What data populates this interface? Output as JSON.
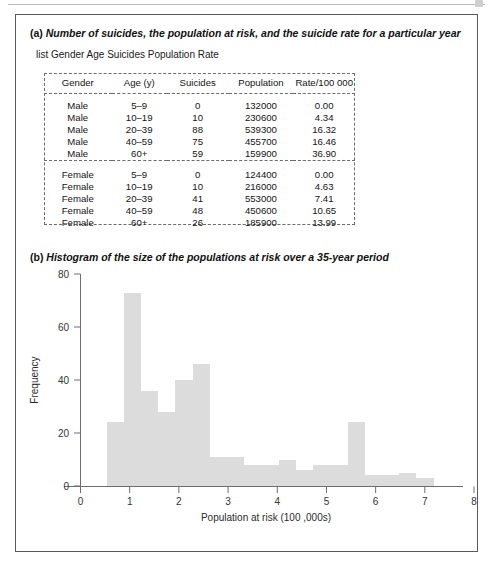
{
  "figure": {
    "panel_a": {
      "label": "(a)",
      "caption": "Number of suicides, the population at risk, and the suicide rate for a particular year",
      "command": "list Gender Age Suicides Population Rate",
      "table": {
        "headers": [
          "Gender",
          "Age (y)",
          "Suicides",
          "Population",
          "Rate/100 000"
        ],
        "groups": [
          {
            "rows": [
              [
                "Male",
                "5–9",
                "0",
                "132000",
                "0.00"
              ],
              [
                "Male",
                "10–19",
                "10",
                "230600",
                "4.34"
              ],
              [
                "Male",
                "20–39",
                "88",
                "539300",
                "16.32"
              ],
              [
                "Male",
                "40–59",
                "75",
                "455700",
                "16.46"
              ],
              [
                "Male",
                "60+",
                "59",
                "159900",
                "36.90"
              ]
            ]
          },
          {
            "rows": [
              [
                "Female",
                "5–9",
                "0",
                "124400",
                "0.00"
              ],
              [
                "Female",
                "10–19",
                "10",
                "216000",
                "4.63"
              ],
              [
                "Female",
                "20–39",
                "41",
                "553000",
                "7.41"
              ],
              [
                "Female",
                "40–59",
                "48",
                "450600",
                "10.65"
              ],
              [
                "Female",
                "60+",
                "26",
                "185900",
                "13.99"
              ]
            ]
          }
        ]
      }
    },
    "panel_b": {
      "label": "(b)",
      "caption": "Histogram of the size of the populations at risk over a 35-year period"
    }
  },
  "chart_data": {
    "type": "bar",
    "title": "Histogram of the size of the populations at risk over a 35-year period",
    "xlabel": "Population at risk (100 ,000s)",
    "ylabel": "Frequency",
    "xlim": [
      0,
      8
    ],
    "ylim": [
      0,
      80
    ],
    "xticks": [
      0,
      1,
      2,
      3,
      4,
      5,
      6,
      7,
      8
    ],
    "yticks": [
      0,
      20,
      40,
      60,
      80
    ],
    "grid": false,
    "bin_width": 0.35,
    "bar_color": "#dcdcdc",
    "bins": [
      {
        "x0": 0.53,
        "x1": 0.88,
        "value": 24
      },
      {
        "x0": 0.88,
        "x1": 1.23,
        "value": 73
      },
      {
        "x0": 1.23,
        "x1": 1.58,
        "value": 36
      },
      {
        "x0": 1.58,
        "x1": 1.93,
        "value": 28
      },
      {
        "x0": 1.93,
        "x1": 2.28,
        "value": 40
      },
      {
        "x0": 2.28,
        "x1": 2.63,
        "value": 46
      },
      {
        "x0": 2.63,
        "x1": 2.98,
        "value": 11
      },
      {
        "x0": 2.98,
        "x1": 3.33,
        "value": 11
      },
      {
        "x0": 3.33,
        "x1": 3.68,
        "value": 8
      },
      {
        "x0": 3.68,
        "x1": 4.03,
        "value": 8
      },
      {
        "x0": 4.03,
        "x1": 4.38,
        "value": 10
      },
      {
        "x0": 4.38,
        "x1": 4.73,
        "value": 6
      },
      {
        "x0": 4.73,
        "x1": 5.08,
        "value": 8
      },
      {
        "x0": 5.08,
        "x1": 5.43,
        "value": 8
      },
      {
        "x0": 5.43,
        "x1": 5.78,
        "value": 24
      },
      {
        "x0": 5.78,
        "x1": 6.13,
        "value": 4
      },
      {
        "x0": 6.13,
        "x1": 6.48,
        "value": 4
      },
      {
        "x0": 6.48,
        "x1": 6.83,
        "value": 5
      },
      {
        "x0": 6.83,
        "x1": 7.18,
        "value": 3
      }
    ]
  }
}
